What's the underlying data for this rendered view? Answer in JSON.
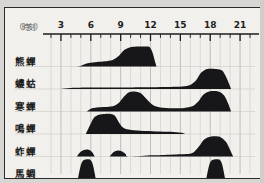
{
  "figure": {
    "axis_caption": "（時刻）",
    "background_color": "#f2f0ec",
    "ink_color": "#17171a",
    "border_color": "#2b2b2b"
  },
  "chart_data": {
    "type": "area",
    "title": "",
    "subtitle": "",
    "xlabel": "（時刻）",
    "ylabel": "",
    "xlim": [
      2,
      22.5
    ],
    "grid": true,
    "legend": "none",
    "tick_labels": [
      "3",
      "6",
      "9",
      "12",
      "15",
      "18",
      "21"
    ],
    "x_ticks": [
      3,
      6,
      9,
      12,
      15,
      18,
      21
    ],
    "minor_tick_step": 1,
    "note": "Singing-activity profiles of six cicada/insect species across a 24-hour clock; each row is an independent filled curve on its own baseline.",
    "series": [
      {
        "name": "熊蟬",
        "row": 1,
        "x": [
          3.0,
          4.6,
          5.2,
          5.8,
          6.6,
          7.4,
          8.2,
          8.8,
          9.3,
          9.9,
          10.6,
          11.4,
          11.9,
          12.2,
          12.45,
          12.6
        ],
        "values": [
          0.0,
          0.0,
          0.08,
          0.17,
          0.22,
          0.26,
          0.33,
          0.52,
          0.8,
          0.95,
          1.0,
          1.0,
          0.97,
          0.7,
          0.25,
          0.0
        ]
      },
      {
        "name": "螻蛄",
        "row": 2,
        "x": [
          3.0,
          4.0,
          6.0,
          9.0,
          12.0,
          14.0,
          15.2,
          16.0,
          16.6,
          17.1,
          17.7,
          18.6,
          19.2,
          19.6,
          19.9,
          20.1
        ],
        "values": [
          0.0,
          0.05,
          0.07,
          0.08,
          0.09,
          0.1,
          0.12,
          0.2,
          0.45,
          0.82,
          1.0,
          1.0,
          0.92,
          0.6,
          0.25,
          0.0
        ]
      },
      {
        "name": "寒蟬",
        "row": 3,
        "x": [
          5.6,
          6.0,
          6.6,
          7.4,
          8.2,
          8.8,
          9.3,
          9.8,
          10.4,
          11.0,
          11.6,
          12.2,
          13.0,
          14.2,
          15.4,
          16.2,
          16.8,
          17.3,
          17.9,
          18.8,
          19.4,
          19.8,
          20.1
        ],
        "values": [
          0.0,
          0.14,
          0.2,
          0.22,
          0.26,
          0.42,
          0.72,
          0.95,
          1.0,
          0.92,
          0.62,
          0.34,
          0.2,
          0.16,
          0.18,
          0.26,
          0.5,
          0.84,
          1.0,
          1.0,
          0.8,
          0.4,
          0.0
        ]
      },
      {
        "name": "鳴蟬",
        "row": 4,
        "x": [
          5.5,
          5.9,
          6.3,
          6.8,
          7.4,
          8.0,
          8.4,
          8.8,
          9.2,
          9.8,
          11.0,
          12.6,
          14.0,
          15.1,
          15.5
        ],
        "values": [
          0.0,
          0.42,
          0.8,
          0.96,
          1.0,
          1.0,
          0.92,
          0.6,
          0.34,
          0.22,
          0.16,
          0.13,
          0.11,
          0.06,
          0.0
        ]
      },
      {
        "name": "蚱蟬",
        "row": 5,
        "x": [
          4.6,
          4.9,
          5.3,
          5.7,
          6.1,
          6.4,
          7.9,
          8.3,
          8.7,
          9.1,
          9.5,
          9.8,
          12.2,
          13.4,
          14.6,
          15.6,
          16.3,
          16.9,
          17.4,
          18.1,
          19.0,
          19.6,
          20.0,
          20.3
        ],
        "values": [
          0.0,
          0.2,
          0.33,
          0.35,
          0.24,
          0.0,
          0.0,
          0.22,
          0.3,
          0.26,
          0.12,
          0.0,
          0.06,
          0.08,
          0.1,
          0.12,
          0.2,
          0.52,
          0.85,
          1.0,
          0.98,
          0.72,
          0.32,
          0.0
        ]
      },
      {
        "name": "馬蜩",
        "row": 6,
        "x": [
          4.7,
          5.0,
          5.3,
          5.9,
          6.2,
          6.5,
          17.6,
          17.9,
          18.2,
          18.9,
          19.2,
          19.5
        ],
        "values": [
          0.0,
          0.7,
          0.95,
          0.97,
          0.72,
          0.0,
          0.0,
          0.7,
          0.95,
          0.97,
          0.72,
          0.0
        ]
      }
    ]
  },
  "row_labels": [
    "熊蟬",
    "螻蛄",
    "寒蟬",
    "鳴蟬",
    "蚱蟬",
    "馬蜩"
  ]
}
